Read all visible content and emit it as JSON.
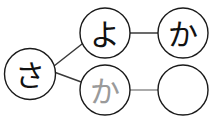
{
  "canvas": {
    "width": 213,
    "height": 123,
    "background": "#ffffff"
  },
  "style": {
    "node_stroke_dark": "#1a1a1a",
    "node_stroke_gray": "#8a8a8a",
    "node_fill": "#ffffff",
    "glyph_dark": "#111111",
    "glyph_gray": "#9a9a9a",
    "edge_dark": "#3a3a3a",
    "edge_gray": "#8f8f8f",
    "node_stroke_width": 1.4,
    "edge_stroke_width": 1.6
  },
  "diagram": {
    "type": "node-link-graph",
    "nodes": [
      {
        "id": "node-sa",
        "label": "さ",
        "reading": "sa",
        "cx": 30,
        "cy": 74,
        "r": 25.5,
        "label_size": 30,
        "label_dx": 0,
        "label_dy": 1,
        "stroke": "#1a1a1a",
        "text_color": "#111111",
        "empty": false,
        "dimmed": false
      },
      {
        "id": "node-yo",
        "label": "よ",
        "reading": "yo",
        "cx": 105,
        "cy": 33,
        "r": 25,
        "label_size": 30,
        "label_dx": 0,
        "label_dy": 1,
        "stroke": "#1a1a1a",
        "text_color": "#111111",
        "empty": false,
        "dimmed": false
      },
      {
        "id": "node-ka-top",
        "label": "か",
        "reading": "ka",
        "cx": 183,
        "cy": 33,
        "r": 25,
        "label_size": 30,
        "label_dx": 0,
        "label_dy": 1,
        "stroke": "#1a1a1a",
        "text_color": "#111111",
        "empty": false,
        "dimmed": false
      },
      {
        "id": "node-ka-ghost",
        "label": "か",
        "reading": "ka",
        "cx": 105,
        "cy": 90,
        "r": 25,
        "label_size": 30,
        "label_dx": 0,
        "label_dy": 1,
        "stroke": "#1a1a1a",
        "text_color": "#9a9a9a",
        "empty": false,
        "dimmed": true
      },
      {
        "id": "node-blank",
        "label": "",
        "reading": "",
        "cx": 183,
        "cy": 90,
        "r": 25,
        "label_size": 30,
        "label_dx": 0,
        "label_dy": 1,
        "stroke": "#1a1a1a",
        "text_color": "#111111",
        "empty": true,
        "dimmed": false
      }
    ],
    "edges": [
      {
        "id": "edge-sa-yo",
        "from": "node-sa",
        "to": "node-yo",
        "x1": 54,
        "y1": 66,
        "x2": 82,
        "y2": 44,
        "stroke": "#3a3a3a",
        "width": 1.5
      },
      {
        "id": "edge-sa-ka-ghost",
        "from": "node-sa",
        "to": "node-ka-ghost",
        "x1": 54,
        "y1": 72,
        "x2": 84,
        "y2": 83,
        "stroke": "#3a3a3a",
        "width": 1.5
      },
      {
        "id": "edge-yo-ka",
        "from": "node-yo",
        "to": "node-ka-top",
        "x1": 130,
        "y1": 33,
        "x2": 158,
        "y2": 33,
        "stroke": "#3a3a3a",
        "width": 1.7
      },
      {
        "id": "edge-ka-ghost-blank",
        "from": "node-ka-ghost",
        "to": "node-blank",
        "x1": 130,
        "y1": 90,
        "x2": 158,
        "y2": 90,
        "stroke": "#8f8f8f",
        "width": 1.7
      }
    ]
  }
}
